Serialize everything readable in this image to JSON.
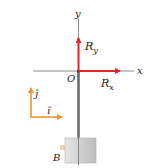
{
  "diagram": {
    "axes": {
      "x_label": "x",
      "y_label": "y",
      "origin_label": "O"
    },
    "forces": [
      {
        "label_main": "R",
        "label_sub": "y",
        "direction": "up",
        "color": "#e0262b"
      },
      {
        "label_main": "R",
        "label_sub": "x",
        "direction": "right",
        "color": "#e0262b"
      }
    ],
    "unit_vectors": {
      "j_label": "ĵ",
      "i_label": "î",
      "color": "#f0932b"
    },
    "point_label": "B",
    "colors": {
      "axis": "#6d6d6d",
      "force": "#e0262b",
      "unit_vector": "#f0932b",
      "rod": "#7a7a7a",
      "weight_fill": "#d4d4d4"
    }
  }
}
